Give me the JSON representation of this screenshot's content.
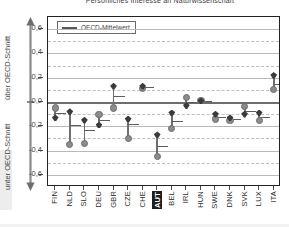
{
  "title": "Persönliches Interesse an Naturwissenschaft",
  "legend": {
    "label": "OECD-Mittelwert"
  },
  "axis": {
    "above_label": "über OECD-Schnitt",
    "below_label": "unter OECD-Schnitt"
  },
  "chart_data": {
    "type": "scatter",
    "title": "Persönliches Interesse an Naturwissenschaft",
    "xlabel": "",
    "ylabel": "über OECD-Schnitt / unter OECD-Schnitt",
    "ylim": [
      -0.7,
      0.7
    ],
    "yticks": [
      0.6,
      0.4,
      0.2,
      0.0,
      -0.2,
      -0.4,
      -0.6
    ],
    "ytick_labels": [
      "0,6",
      "0,4",
      "0,2",
      "0,0",
      "-0,2",
      "-0,4",
      "-0,6"
    ],
    "grid": true,
    "legend_position": "top-left",
    "reference_line": {
      "value": 0.0,
      "label": "OECD-Mittelwert"
    },
    "categories": [
      "FIN",
      "NLD",
      "SLO",
      "DEU",
      "GBR",
      "CZE",
      "CHE",
      "AUT",
      "BEL",
      "IRL",
      "HUN",
      "SWE",
      "DNK",
      "SVK",
      "LUX",
      "ITA"
    ],
    "highlighted_category": "AUT",
    "series": [
      {
        "name": "oberer Wert",
        "marker": "diamond",
        "color": "#3b3b3b",
        "values": [
          -0.13,
          -0.08,
          -0.15,
          -0.19,
          0.13,
          -0.14,
          0.13,
          -0.27,
          -0.09,
          -0.03,
          0.01,
          -0.1,
          -0.13,
          -0.1,
          -0.09,
          0.22
        ]
      },
      {
        "name": "unterer Wert",
        "marker": "circle",
        "color": "#8c8c8c",
        "values": [
          -0.05,
          -0.35,
          -0.34,
          -0.1,
          -0.05,
          -0.3,
          0.11,
          -0.45,
          -0.22,
          0.04,
          0.01,
          -0.14,
          -0.15,
          -0.04,
          -0.15,
          0.1
        ]
      },
      {
        "name": "Mittelwert",
        "marker": "hbar",
        "color": "#5d5d5d",
        "values": [
          -0.09,
          -0.19,
          -0.23,
          -0.15,
          0.05,
          -0.18,
          0.12,
          -0.36,
          -0.16,
          0.0,
          0.01,
          -0.12,
          -0.14,
          -0.07,
          -0.12,
          0.15
        ]
      }
    ]
  }
}
